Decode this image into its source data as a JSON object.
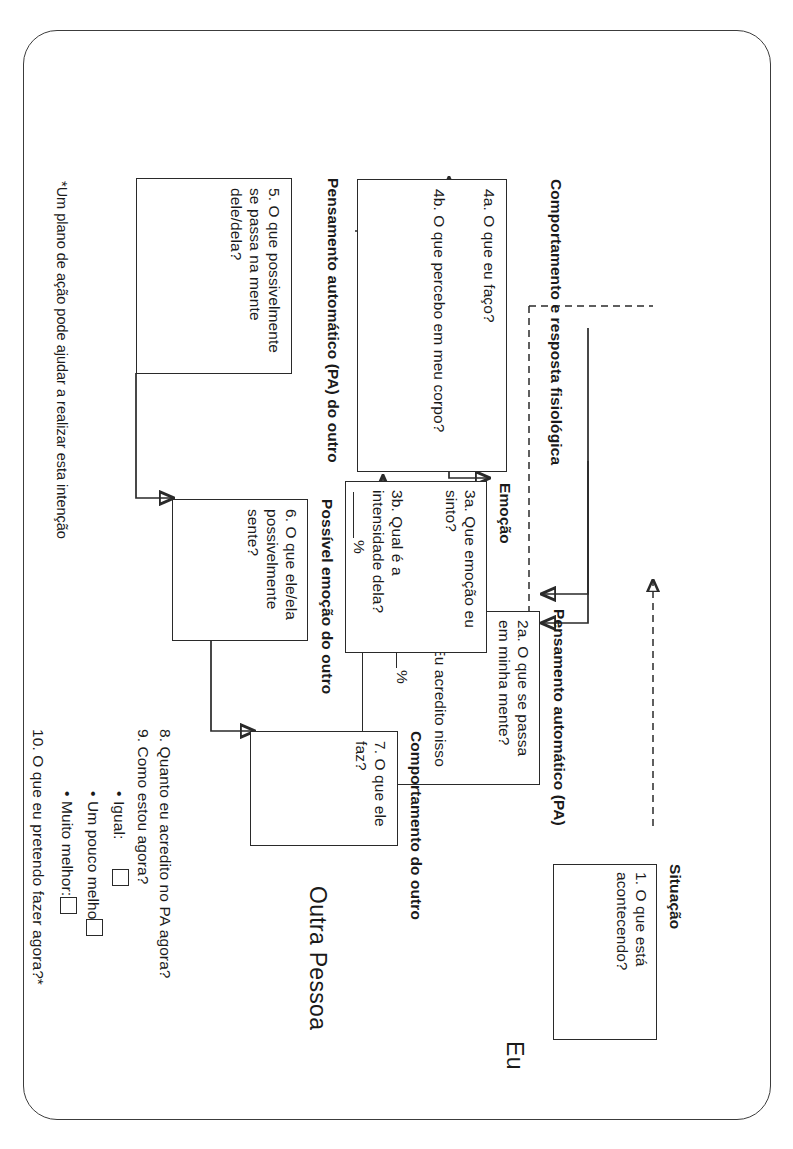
{
  "sheet": {
    "self_label": "Eu",
    "other_label": "Outra Pessoa",
    "footnote": "*Um plano de ação pode ajudar a realizar esta intenção"
  },
  "boxes": {
    "situacao": {
      "header": "Situação",
      "items": [
        "1. O que está acontecendo?"
      ]
    },
    "pensamento_automatico": {
      "header": "Pensamento automático  (PA)",
      "items": [
        "2a. O que se passa em minha mente?",
        "2b. Eu acredito nisso"
      ],
      "suffix": "%"
    },
    "emocao": {
      "header": "Emoção",
      "items": [
        "3a. Que emoção eu sinto?",
        "3b. Qual é a intensidade dela?"
      ],
      "suffix": "%"
    },
    "comportamento": {
      "header": "Comportamento e resposta fisiológica",
      "items": [
        "4a. O que eu faço?",
        "4b. O que percebo em meu corpo?"
      ]
    },
    "pa_do_outro": {
      "header": "Pensamento automático (PA) do outro",
      "items": [
        "5. O que possivelmente se passa na mente dele/dela?"
      ]
    },
    "emocao_do_outro": {
      "header": "Possível emoção do outro",
      "items": [
        "6. O que ele/ela possivelmente sente?"
      ]
    },
    "comportamento_do_outro": {
      "header": "Comportamento do outro",
      "items": [
        "7. O que ele faz?"
      ]
    }
  },
  "questions": {
    "q8": "8. Quanto eu acredito no PA agora?",
    "q9": "9. Como estou agora?",
    "options": [
      {
        "label": "• Igual:"
      },
      {
        "label": "• Um pouco melhor:"
      },
      {
        "label": "• Muito melhor:"
      }
    ],
    "q10": "10. O que eu pretendo fazer agora?*"
  },
  "colors": {
    "ink": "#2a2a2a",
    "border": "#3c3c3c",
    "paper": "#ffffff"
  }
}
